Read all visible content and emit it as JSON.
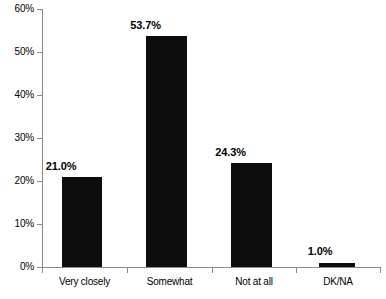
{
  "chart_data": {
    "type": "bar",
    "title": "",
    "subtitle": "",
    "xlabel": "",
    "ylabel": "",
    "categories": [
      "Very closely",
      "Somewhat",
      "Not at all",
      "DK/NA"
    ],
    "values": [
      21.0,
      53.7,
      24.3,
      1.0
    ],
    "data_labels": [
      "21.0%",
      "53.7%",
      "24.3%",
      "1.0%"
    ],
    "ylim": [
      0,
      60
    ],
    "ytick_values": [
      0,
      10,
      20,
      30,
      40,
      50,
      60
    ],
    "ytick_labels": [
      "0%",
      "10%",
      "20%",
      "30%",
      "40%",
      "50%",
      "60%"
    ],
    "grid": false,
    "legend": false,
    "legend_position": "none",
    "bar_color": "#0d0d0d",
    "axis_color": "#8a8a8a",
    "background_color": "#ffffff"
  }
}
